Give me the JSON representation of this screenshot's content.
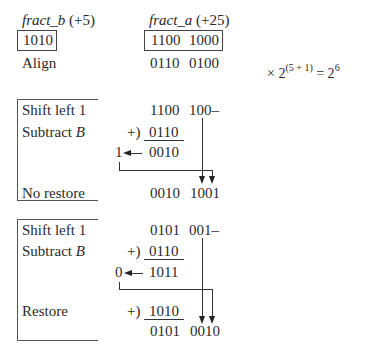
{
  "header": {
    "fract_b_name": "fract_b",
    "fract_b_exp": " (+5)",
    "fract_a_name": "fract_a",
    "fract_a_exp": " (+25)",
    "divisor_value": "1010",
    "dividend_high": "1100",
    "dividend_low": "1000",
    "align_label": "Align",
    "aligned_high": "0110",
    "aligned_low": "0100",
    "scale_prefix": "× 2",
    "scale_exp": "(5 + 1)",
    "scale_eq": " = 2",
    "scale_result_exp": "6"
  },
  "step1": {
    "shift_label": "Shift left 1",
    "subtract_label": "Subtract ",
    "subtract_var": "B",
    "shifted_high": "1100",
    "shifted_low": "100–",
    "add_op": "+)",
    "addend": "0110",
    "carry": "1",
    "sum": "0010",
    "result_label": "No restore",
    "result_high": "0010",
    "result_low": "1001"
  },
  "step2": {
    "shift_label": "Shift left 1",
    "subtract_label": "Subtract ",
    "subtract_var": "B",
    "shifted_high": "0101",
    "shifted_low": "001–",
    "add_op": "+)",
    "addend": "0110",
    "carry": "0",
    "sum": "1011",
    "result_label": "Restore",
    "restore_op": "+)",
    "restore_addend": "1010",
    "result_high": "0101",
    "result_low": "0010"
  }
}
